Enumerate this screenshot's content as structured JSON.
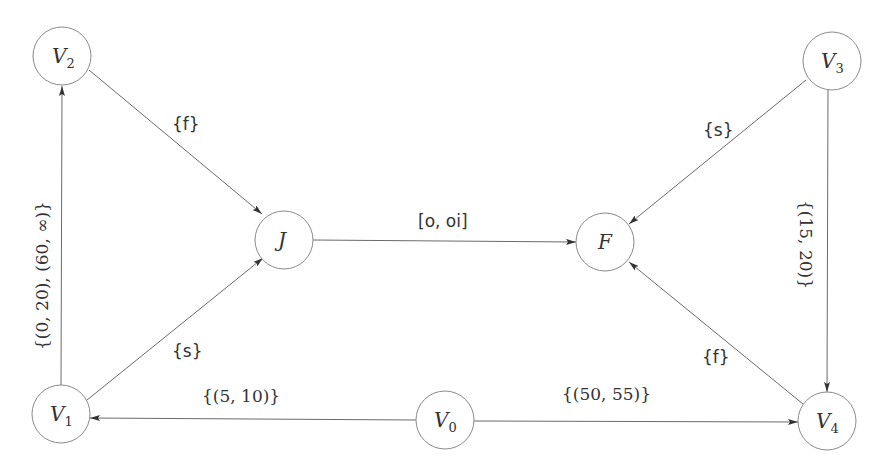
{
  "nodes": [
    {
      "id": "V0",
      "label": "V",
      "sub": "0",
      "x": 445,
      "y": 420
    },
    {
      "id": "V1",
      "label": "V",
      "sub": "1",
      "x": 61,
      "y": 414
    },
    {
      "id": "V2",
      "label": "V",
      "sub": "2",
      "x": 62,
      "y": 56
    },
    {
      "id": "V3",
      "label": "V",
      "sub": "3",
      "x": 832,
      "y": 61
    },
    {
      "id": "V4",
      "label": "V",
      "sub": "4",
      "x": 827,
      "y": 421
    },
    {
      "id": "J",
      "label": "J",
      "sub": "",
      "x": 284,
      "y": 240
    },
    {
      "id": "F",
      "label": "F",
      "sub": "",
      "x": 605,
      "y": 242
    }
  ],
  "edges": [
    {
      "from": "V1",
      "to": "V2",
      "label": "{(0, 20), (60, ∞)}"
    },
    {
      "from": "V2",
      "to": "J",
      "label": "{f}"
    },
    {
      "from": "V1",
      "to": "J",
      "label": "{s}"
    },
    {
      "from": "J",
      "to": "F",
      "label": "[o, oi]"
    },
    {
      "from": "V3",
      "to": "F",
      "label": "{s}"
    },
    {
      "from": "V3",
      "to": "V4",
      "label": "{(15, 20)}"
    },
    {
      "from": "V4",
      "to": "F",
      "label": "{f}"
    },
    {
      "from": "V0",
      "to": "V1",
      "label": "{(5, 10)}"
    },
    {
      "from": "V0",
      "to": "V4",
      "label": "{(50, 55)}"
    }
  ]
}
